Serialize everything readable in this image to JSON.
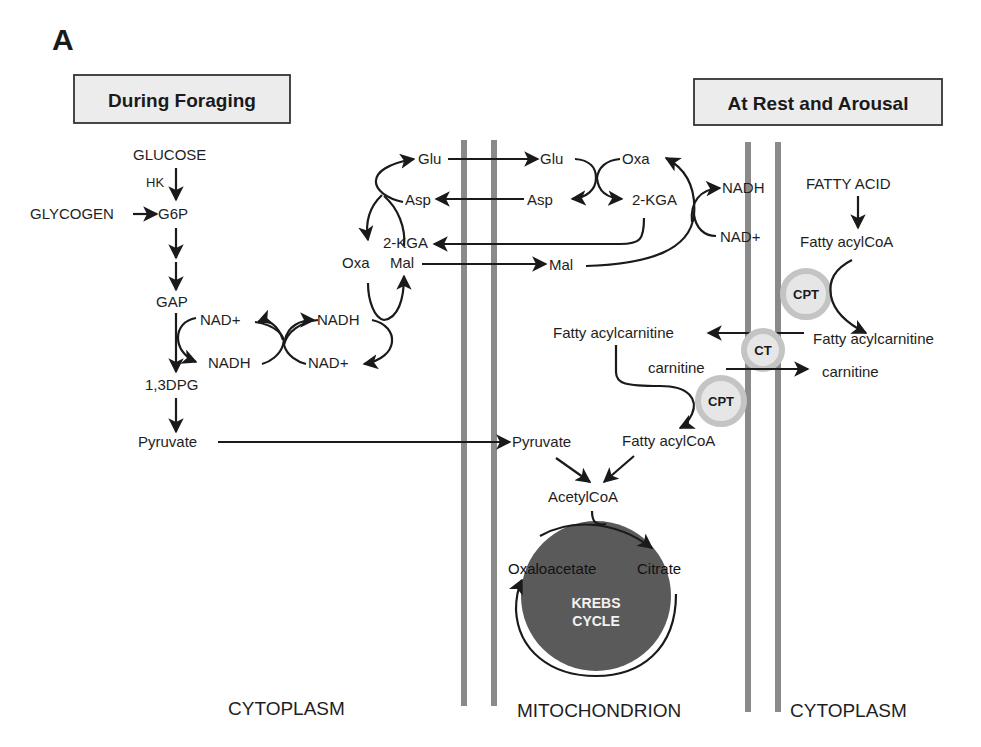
{
  "panel_label": "A",
  "headers": {
    "left": "During Foraging",
    "right": "At Rest and Arousal"
  },
  "regions": {
    "left": "CYTOPLASM",
    "middle": "MITOCHONDRION",
    "right": "CYTOPLASM"
  },
  "glycolysis": {
    "glucose": "GLUCOSE",
    "hk": "HK",
    "glycogen": "GLYCOGEN",
    "g6p": "G6P",
    "gap": "GAP",
    "dpg": "1,3DPG",
    "pyruvate": "Pyruvate"
  },
  "shuttle_cyto": {
    "nad_plus_1": "NAD+",
    "nadh_1": "NADH",
    "nadh_2": "NADH",
    "nad_plus_2": "NAD+",
    "glu": "Glu",
    "asp": "Asp",
    "kga": "2-KGA",
    "oxa": "Oxa",
    "mal": "Mal"
  },
  "shuttle_mito": {
    "glu": "Glu",
    "oxa": "Oxa",
    "asp": "Asp",
    "kga": "2-KGA",
    "mal": "Mal",
    "nadh": "NADH",
    "nad_plus": "NAD+"
  },
  "fatty_acid": {
    "fatty_acid": "FATTY ACID",
    "fatty_acylcoa_cyto": "Fatty acylCoA",
    "cpt_outer": "CPT",
    "fatty_acylcarnitine_cyto": "Fatty acylcarnitine",
    "ct": "CT",
    "carnitine_cyto": "carnitine",
    "fatty_acylcarnitine_mito": "Fatty acylcarnitine",
    "carnitine_mito": "carnitine",
    "cpt_inner": "CPT",
    "fatty_acylcoa_mito": "Fatty acylCoA"
  },
  "mito": {
    "pyruvate": "Pyruvate",
    "acetylcoa": "AcetylCoA",
    "oxaloacetate": "Oxaloacetate",
    "citrate": "Citrate",
    "krebs_line1": "KREBS",
    "krebs_line2": "CYCLE"
  },
  "colors": {
    "ink": "#1a1a1a",
    "membrane": "#8a8a8a",
    "header_fill": "#ececec",
    "krebs_fill": "#5a5a5a",
    "enzyme_ring": "#c8c8c8",
    "enzyme_fill": "#e6e6e6"
  }
}
